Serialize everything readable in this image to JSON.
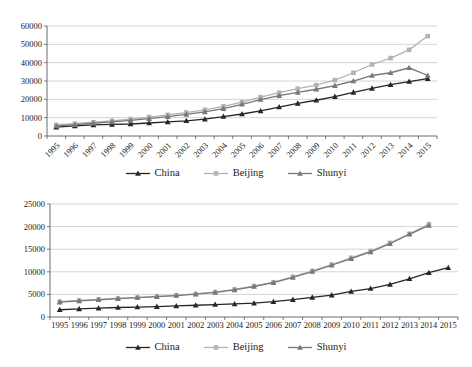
{
  "page": {
    "background": "#ffffff"
  },
  "colors": {
    "grid": "#c9c9c9",
    "axis": "#595959",
    "text": "#1a1a1a",
    "china": "#262626",
    "beijing": "#b3b3b3",
    "shunyi": "#787878"
  },
  "chart_data": [
    {
      "id": "top-chart",
      "type": "line",
      "title": "",
      "xlabel": "",
      "ylabel": "",
      "ylim": [
        0,
        60000
      ],
      "yticks": [
        0,
        10000,
        20000,
        30000,
        40000,
        50000,
        60000
      ],
      "grid": true,
      "legend_position": "bottom-center",
      "x_labels_rotated": true,
      "categories": [
        "1995",
        "1996",
        "1997",
        "1998",
        "1999",
        "2000",
        "2001",
        "2002",
        "2003",
        "2004",
        "2005",
        "2006",
        "2007",
        "2008",
        "2009",
        "2010",
        "2011",
        "2012",
        "2013",
        "2014",
        "2015"
      ],
      "series": [
        {
          "name": "China",
          "color": "#262626",
          "marker": "triangle",
          "values": [
            4850,
            5550,
            6050,
            6300,
            6550,
            7100,
            7700,
            8300,
            9200,
            10600,
            12000,
            13700,
            15800,
            17800,
            19500,
            21500,
            23800,
            26000,
            28000,
            29700,
            31300
          ]
        },
        {
          "name": "Beijing",
          "color": "#b3b3b3",
          "marker": "square",
          "values": [
            6000,
            6750,
            7500,
            8300,
            9250,
            10350,
            11550,
            12800,
            14300,
            16200,
            18500,
            21200,
            23600,
            25800,
            27800,
            30500,
            34500,
            39000,
            42500,
            47000,
            54500
          ]
        },
        {
          "name": "Shunyi",
          "color": "#787878",
          "marker": "triangle",
          "values": [
            5500,
            6200,
            6950,
            7700,
            8500,
            9450,
            10550,
            11750,
            13150,
            14950,
            17300,
            19900,
            22000,
            23800,
            25500,
            27500,
            30000,
            33000,
            34500,
            37200,
            33000
          ]
        }
      ]
    },
    {
      "id": "bottom-chart",
      "type": "line",
      "title": "",
      "xlabel": "",
      "ylabel": "",
      "ylim": [
        0,
        25000
      ],
      "yticks": [
        0,
        5000,
        10000,
        15000,
        20000,
        25000
      ],
      "grid": true,
      "legend_position": "bottom-center",
      "x_labels_rotated": false,
      "categories": [
        "1995",
        "1996",
        "1997",
        "1998",
        "1999",
        "2000",
        "2001",
        "2002",
        "2003",
        "2004",
        "2005",
        "2006",
        "2007",
        "2008",
        "2009",
        "2010",
        "2011",
        "2012",
        "2013",
        "2014",
        "2015"
      ],
      "series": [
        {
          "name": "China",
          "color": "#262626",
          "marker": "triangle",
          "values": [
            1600,
            1800,
            1950,
            2100,
            2200,
            2300,
            2450,
            2600,
            2750,
            2900,
            3050,
            3400,
            3850,
            4350,
            4850,
            5650,
            6300,
            7200,
            8450,
            9800,
            10900
          ]
        },
        {
          "name": "Beijing",
          "color": "#b3b3b3",
          "marker": "square",
          "values": [
            3400,
            3650,
            3900,
            4100,
            4300,
            4550,
            4800,
            5100,
            5500,
            6100,
            6850,
            7700,
            8900,
            10200,
            11600,
            13100,
            14600,
            16400,
            18400,
            20550
          ]
        },
        {
          "name": "Shunyi",
          "color": "#787878",
          "marker": "triangle",
          "values": [
            3300,
            3550,
            3800,
            4050,
            4300,
            4500,
            4750,
            5050,
            5450,
            6000,
            6750,
            7600,
            8750,
            10050,
            11450,
            12900,
            14400,
            16200,
            18300,
            20250
          ]
        }
      ]
    }
  ]
}
